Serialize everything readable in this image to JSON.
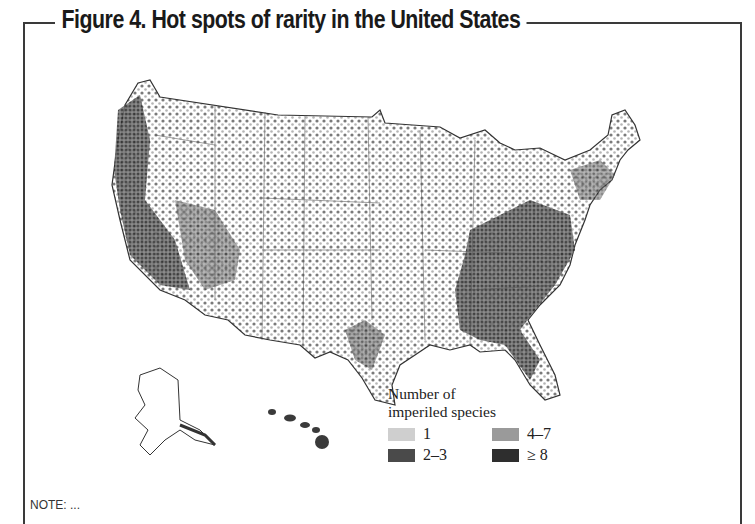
{
  "figure": {
    "title": "Figure 4. Hot spots of rarity in the United States",
    "note_fragment": "NOTE: ..."
  },
  "map": {
    "region": "United States (contiguous, Alaska, Hawaii)",
    "depiction": "Dot density map of imperiled species occurrences; dense clusters along West Coast (California, Oregon), Southwest, Appalachians and Southeast (Tennessee, Alabama, Georgia), Florida, Texas Gulf coast; sparse in Great Plains."
  },
  "legend": {
    "heading_line1": "Number of",
    "heading_line2": "imperiled species",
    "items": [
      {
        "label": "1",
        "color": "#cfcfcf"
      },
      {
        "label": "4–7",
        "color": "#9a9a9a"
      },
      {
        "label": "2–3",
        "color": "#4a4a4a"
      },
      {
        "label": "≥ 8",
        "color": "#2e2e2e"
      }
    ]
  }
}
